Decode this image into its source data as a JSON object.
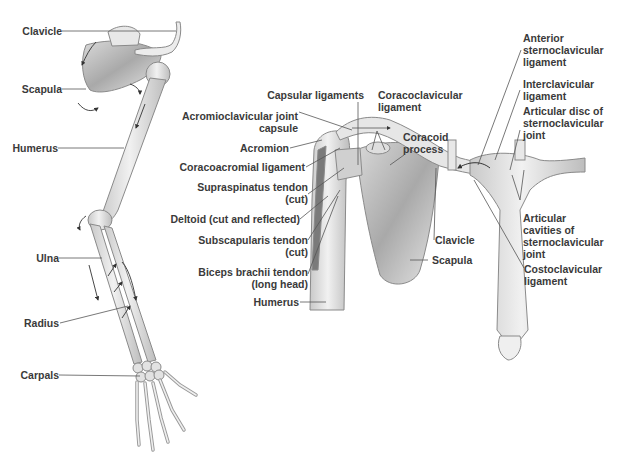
{
  "figure": {
    "left_panel": {
      "title": "Upper limb skeleton (anterior view)",
      "labels": [
        {
          "id": "clavicle",
          "text": "Clavicle"
        },
        {
          "id": "scapula",
          "text": "Scapula"
        },
        {
          "id": "humerus",
          "text": "Humerus"
        },
        {
          "id": "ulna",
          "text": "Ulna"
        },
        {
          "id": "radius",
          "text": "Radius"
        },
        {
          "id": "carpals",
          "text": "Carpals"
        }
      ]
    },
    "right_panel": {
      "labels": [
        {
          "id": "capsular-ligaments",
          "text": "Capsular ligaments"
        },
        {
          "id": "coracoclavicular-ligament",
          "text": "Coracoclavicular\nligament"
        },
        {
          "id": "acromioclavicular-joint-capsule",
          "text": "Acromioclavicular joint\ncapsule"
        },
        {
          "id": "coracoid-process",
          "text": "Coracoid\nprocess"
        },
        {
          "id": "acromion",
          "text": "Acromion"
        },
        {
          "id": "coracoacromial-ligament",
          "text": "Coracoacromial ligament"
        },
        {
          "id": "supraspinatus-tendon",
          "text": "Supraspinatus tendon\n(cut)"
        },
        {
          "id": "deltoid",
          "text": "Deltoid (cut and reflected)"
        },
        {
          "id": "subscapularis-tendon",
          "text": "Subscapularis tendon\n(cut)"
        },
        {
          "id": "biceps-brachii-tendon",
          "text": "Biceps brachii tendon\n(long head)"
        },
        {
          "id": "humerus",
          "text": "Humerus"
        },
        {
          "id": "clavicle",
          "text": "Clavicle"
        },
        {
          "id": "scapula",
          "text": "Scapula"
        },
        {
          "id": "anterior-sternoclavicular-ligament",
          "text": "Anterior\nsternoclavicular\nligament"
        },
        {
          "id": "interclavicular-ligament",
          "text": "Interclavicular\nligament"
        },
        {
          "id": "articular-disc",
          "text": "Articular disc of\nsternoclavicular\njoint"
        },
        {
          "id": "articular-cavities",
          "text": "Articular\ncavities of\nsternoclavicular\njoint"
        },
        {
          "id": "costoclavicular-ligament",
          "text": "Costoclavicular\nligament"
        }
      ]
    },
    "colors": {
      "label_text": "#3a3a3a",
      "leader_line": "#555555",
      "bone_fill": "#e4e4e4",
      "bone_shade": "#b8b8b8",
      "bone_outline": "#8a8a8a"
    }
  }
}
